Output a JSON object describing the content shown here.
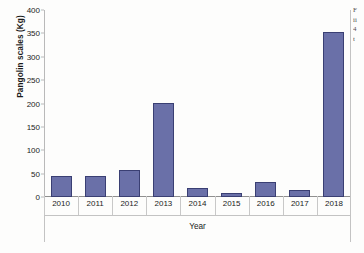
{
  "chart_data": {
    "type": "bar",
    "title": "",
    "xlabel": "Year",
    "ylabel": "Pangolin scales (Kg)",
    "categories": [
      "2010",
      "2011",
      "2012",
      "2013",
      "2014",
      "2015",
      "2016",
      "2017",
      "2018"
    ],
    "values": [
      46,
      46,
      57,
      201,
      19,
      8,
      32,
      15,
      352
    ],
    "series": [
      {
        "name": "Pangolin scales (Kg)",
        "values": [
          46,
          46,
          57,
          201,
          19,
          8,
          32,
          15,
          352
        ]
      }
    ],
    "ylim": [
      0,
      400
    ],
    "ytick_labels": [
      "400",
      "350",
      "300",
      "250",
      "200",
      "150",
      "100",
      "50",
      "0"
    ],
    "ytick_values": [
      400,
      350,
      300,
      250,
      200,
      150,
      100,
      50,
      0
    ],
    "ytick_step": 50,
    "grid": false,
    "legend": false,
    "bar_color": "#6a70a8",
    "bar_edge_color": "#3a3f73",
    "axis_color": "#8f8f8f"
  },
  "margin_note": {
    "lines": [
      "F",
      "ii",
      "4",
      "t"
    ]
  }
}
